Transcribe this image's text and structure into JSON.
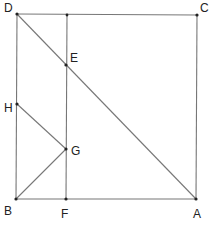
{
  "diagram": {
    "type": "geometry",
    "shape": "square ABCD with internal constructions",
    "colors": {
      "line": "#777777",
      "point": "#222222",
      "label": "#222222",
      "background": "#ffffff"
    },
    "points": {
      "A": {
        "label": "A",
        "x": 196,
        "y": 199,
        "lx": 193,
        "ly": 218
      },
      "B": {
        "label": "B",
        "x": 16,
        "y": 199,
        "lx": 4,
        "ly": 215
      },
      "C": {
        "label": "C",
        "x": 197,
        "y": 15,
        "lx": 200,
        "ly": 12
      },
      "D": {
        "label": "D",
        "x": 17,
        "y": 14,
        "lx": 4,
        "ly": 12
      },
      "E": {
        "label": "E",
        "x": 66,
        "y": 65,
        "lx": 70,
        "ly": 62
      },
      "F": {
        "label": "F",
        "x": 66,
        "y": 199,
        "lx": 61,
        "ly": 218
      },
      "G": {
        "label": "G",
        "x": 66,
        "y": 149,
        "lx": 71,
        "ly": 155
      },
      "H": {
        "label": "H",
        "x": 17,
        "y": 104,
        "lx": 4,
        "ly": 112
      },
      "T": {
        "label": "",
        "x": 67,
        "y": 15
      }
    },
    "segments": [
      [
        "D",
        "C"
      ],
      [
        "C",
        "A"
      ],
      [
        "A",
        "B"
      ],
      [
        "B",
        "D"
      ],
      [
        "D",
        "A"
      ],
      [
        "T",
        "F"
      ],
      [
        "H",
        "G"
      ],
      [
        "B",
        "G"
      ]
    ]
  }
}
